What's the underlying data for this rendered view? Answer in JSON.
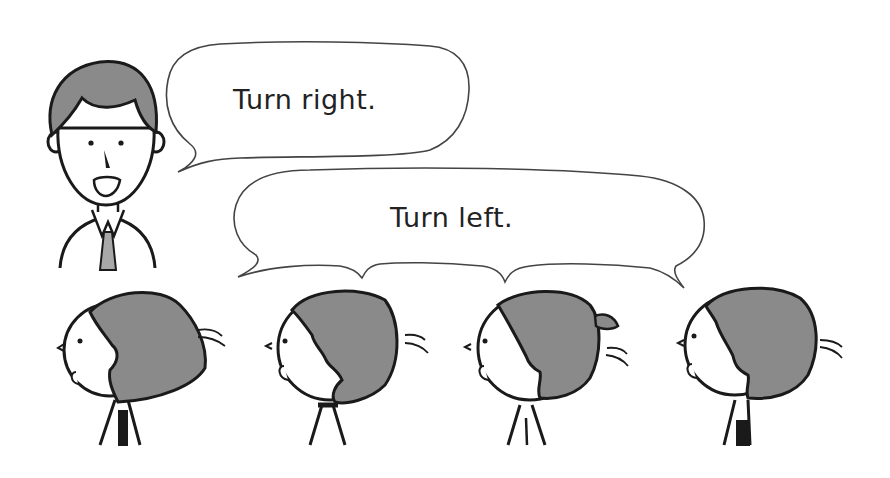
{
  "scene": {
    "description": "Teacher giving direction instructions to a row of students",
    "colors": {
      "background": "#ffffff",
      "outline": "#1a1a1a",
      "hair": "#8a8a8a",
      "tie": "#a8a8a8",
      "bubble_stroke": "#444444"
    }
  },
  "teacher": {
    "label": "teacher",
    "speech": "Turn right."
  },
  "class_response": {
    "speech": "Turn left."
  },
  "students": [
    {
      "label": "student-1",
      "hair": "bob",
      "motion": "turning"
    },
    {
      "label": "student-2",
      "hair": "short",
      "motion": "turning"
    },
    {
      "label": "student-3",
      "hair": "ponytail",
      "motion": "turning"
    },
    {
      "label": "student-4",
      "hair": "short",
      "motion": "turning"
    }
  ]
}
